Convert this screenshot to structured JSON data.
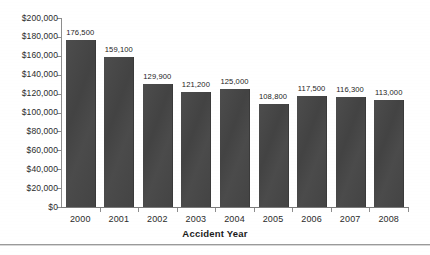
{
  "chart_data": {
    "type": "bar",
    "title": "",
    "subtitle": "",
    "xlabel": "Accident Year",
    "ylabel": "",
    "categories": [
      "2000",
      "2001",
      "2002",
      "2003",
      "2004",
      "2005",
      "2006",
      "2007",
      "2008"
    ],
    "values": [
      176500,
      159100,
      129900,
      121200,
      125000,
      108800,
      117500,
      116300,
      113000
    ],
    "data_labels": [
      "176,500",
      "159,100",
      "129,900",
      "121,200",
      "125,000",
      "108,800",
      "117,500",
      "116,300",
      "113,000"
    ],
    "ylim": [
      0,
      200000
    ],
    "ytick_values": [
      0,
      20000,
      40000,
      60000,
      80000,
      100000,
      120000,
      140000,
      160000,
      180000,
      200000
    ],
    "ytick_labels": [
      "$0",
      "$20,000",
      "$40,000",
      "$60,000",
      "$80,000",
      "$100,000",
      "$120,000",
      "$140,000",
      "$160,000",
      "$180,000",
      "$200,000"
    ],
    "grid": false,
    "legend": null,
    "legend_position": "none",
    "bar_color": "#454545",
    "axis_color": "#8d8d8d",
    "text_color": "#2b2b2b",
    "background_color": "#ffffff"
  },
  "axis": {
    "x_title": "Accident Year"
  }
}
